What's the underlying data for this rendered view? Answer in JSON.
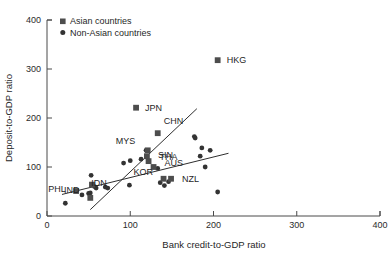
{
  "chart_data": {
    "type": "scatter",
    "title": "",
    "xlabel": "Bank credit-to-GDP ratio",
    "ylabel": "Deposit-to-GDP ratio",
    "xlim": [
      0,
      400
    ],
    "ylim": [
      0,
      400
    ],
    "xticks": [
      0,
      100,
      200,
      300,
      400
    ],
    "yticks": [
      0,
      100,
      200,
      300,
      400
    ],
    "xtick_labels": [
      "0",
      "100",
      "200",
      "300",
      "400"
    ],
    "ytick_labels": [
      "0",
      "100",
      "200",
      "300",
      "400"
    ],
    "grid": false,
    "legend_position": "top-left",
    "series": [
      {
        "name": "Asian countries",
        "marker": "square",
        "color": "#4d4d4d",
        "points": [
          {
            "label": "HKG",
            "x": 205,
            "y": 318,
            "label_dx": 9,
            "label_dy": 3
          },
          {
            "label": "JPN",
            "x": 107,
            "y": 221,
            "label_dx": 9,
            "label_dy": 3
          },
          {
            "label": "CHN",
            "x": 133,
            "y": 169,
            "label_dx": 6,
            "label_dy": -9
          },
          {
            "label": "MYS",
            "x": 121,
            "y": 134,
            "label_dx": -32,
            "label_dy": -6
          },
          {
            "label": "SIN",
            "x": 120,
            "y": 122,
            "label_dx": 11,
            "label_dy": 2
          },
          {
            "label": "THA",
            "x": 122,
            "y": 112,
            "label_dx": 11,
            "label_dy": -1
          },
          {
            "label": "AUS",
            "x": 128,
            "y": 100,
            "label_dx": 11,
            "label_dy": -1
          },
          {
            "label": "KOR",
            "x": 140,
            "y": 76,
            "label_dx": -30,
            "label_dy": -4
          },
          {
            "label": "NZL",
            "x": 149,
            "y": 76,
            "label_dx": 11,
            "label_dy": 3
          },
          {
            "label": "IND",
            "x": 54,
            "y": 64,
            "label_dx": -28,
            "label_dy": 8
          },
          {
            "label": "PHL",
            "x": 35,
            "y": 51,
            "label_dx": -28,
            "label_dy": 1
          },
          {
            "label": "IDN",
            "x": 52,
            "y": 37,
            "label_dx": 1,
            "label_dy": -12
          }
        ]
      },
      {
        "name": "Non-Asian countries",
        "marker": "circle",
        "color": "#333333",
        "points": [
          {
            "x": 22,
            "y": 26
          },
          {
            "x": 42,
            "y": 43
          },
          {
            "x": 50,
            "y": 46
          },
          {
            "x": 52,
            "y": 47
          },
          {
            "x": 53,
            "y": 83
          },
          {
            "x": 57,
            "y": 60
          },
          {
            "x": 59,
            "y": 57
          },
          {
            "x": 70,
            "y": 59
          },
          {
            "x": 73,
            "y": 57
          },
          {
            "x": 92,
            "y": 108
          },
          {
            "x": 99,
            "y": 63
          },
          {
            "x": 100,
            "y": 113
          },
          {
            "x": 113,
            "y": 116
          },
          {
            "x": 119,
            "y": 134
          },
          {
            "x": 133,
            "y": 97
          },
          {
            "x": 136,
            "y": 68
          },
          {
            "x": 141,
            "y": 62
          },
          {
            "x": 146,
            "y": 70
          },
          {
            "x": 177,
            "y": 162
          },
          {
            "x": 178,
            "y": 159
          },
          {
            "x": 186,
            "y": 139
          },
          {
            "x": 184,
            "y": 122
          },
          {
            "x": 196,
            "y": 134
          },
          {
            "x": 190,
            "y": 100
          },
          {
            "x": 205,
            "y": 49
          }
        ]
      }
    ],
    "fit_lines": [
      {
        "name": "asian-fit",
        "x1": 52,
        "y1": 13,
        "x2": 180,
        "y2": 219
      },
      {
        "name": "non-asian-fit",
        "x1": 18,
        "y1": 44,
        "x2": 218,
        "y2": 128
      }
    ]
  },
  "legend": {
    "items": [
      {
        "label": "Asian countries",
        "marker": "square"
      },
      {
        "label": "Non-Asian countries",
        "marker": "circle"
      }
    ]
  }
}
